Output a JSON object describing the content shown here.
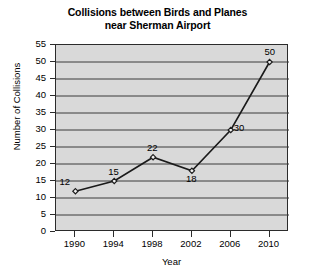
{
  "chart_data": {
    "type": "line",
    "title": "Collisions between Birds and Planes near Sherman Airport",
    "title_lines": [
      "Collisions between Birds and Planes",
      "near Sherman Airport"
    ],
    "xlabel": "Year",
    "ylabel": "Number of Collisions",
    "x": [
      1990,
      1994,
      1998,
      2002,
      2006,
      2010
    ],
    "categories": [
      "1990",
      "1994",
      "1998",
      "2002",
      "2006",
      "2010"
    ],
    "values": [
      12,
      15,
      22,
      18,
      30,
      50
    ],
    "point_labels": [
      "12",
      "15",
      "22",
      "18",
      "30",
      "50"
    ],
    "ylim": [
      0,
      55
    ],
    "xlim": [
      1988,
      2012
    ],
    "ytick_labels": [
      "55",
      "50",
      "45",
      "40",
      "35",
      "30",
      "25",
      "20",
      "15",
      "10",
      "5",
      "0"
    ],
    "yticks": [
      55,
      50,
      45,
      40,
      35,
      30,
      25,
      20,
      15,
      10,
      5,
      0
    ],
    "xtick_labels": [
      "1990",
      "1994",
      "1998",
      "2002",
      "2006",
      "2010"
    ],
    "grid": "horizontal",
    "legend": "none",
    "plot_background_color": "#d9d9d9",
    "line_color": "#1a1a1a",
    "marker": "diamond",
    "marker_color": "#1a1a1a",
    "axis_color": "#2b2b2b",
    "figure_background_color": "#ffffff"
  }
}
